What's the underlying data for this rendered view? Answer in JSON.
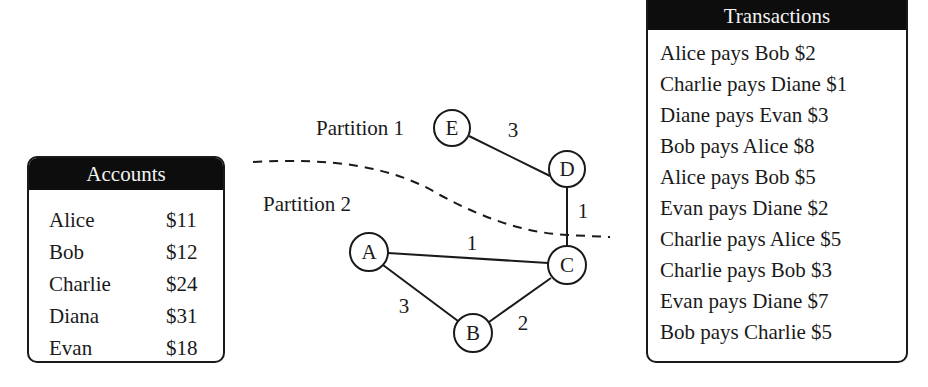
{
  "accounts": {
    "title": "Accounts",
    "rows": [
      {
        "name": "Alice",
        "balance": "$11"
      },
      {
        "name": "Bob",
        "balance": "$12"
      },
      {
        "name": "Charlie",
        "balance": "$24"
      },
      {
        "name": "Diana",
        "balance": "$31"
      },
      {
        "name": "Evan",
        "balance": "$18"
      }
    ]
  },
  "transactions": {
    "title": "Transactions",
    "rows": [
      "Alice pays Bob $2",
      "Charlie pays Diane $1",
      "Diane pays Evan $3",
      "Bob pays Alice $8",
      "Alice pays Bob $5",
      "Evan pays Diane $2",
      "Charlie pays Alice $5",
      "Charlie pays Bob $3",
      "Evan pays Diane $7",
      "Bob pays Charlie $5"
    ]
  },
  "graph": {
    "partitions": [
      "Partition 1",
      "Partition 2"
    ],
    "nodes": [
      {
        "id": "A",
        "label": "A"
      },
      {
        "id": "B",
        "label": "B"
      },
      {
        "id": "C",
        "label": "C"
      },
      {
        "id": "D",
        "label": "D"
      },
      {
        "id": "E",
        "label": "E"
      }
    ],
    "edges": [
      {
        "from": "E",
        "to": "D",
        "weight": "3"
      },
      {
        "from": "D",
        "to": "C",
        "weight": "1"
      },
      {
        "from": "A",
        "to": "C",
        "weight": "1"
      },
      {
        "from": "A",
        "to": "B",
        "weight": "3"
      },
      {
        "from": "B",
        "to": "C",
        "weight": "2"
      }
    ]
  },
  "colors": {
    "header_bg": "#0d0d0d",
    "header_text": "#f2f2f2",
    "ink": "#1a1a1a"
  }
}
